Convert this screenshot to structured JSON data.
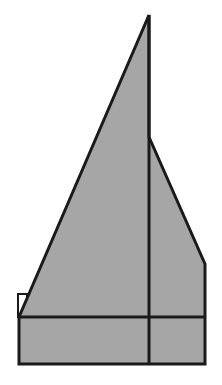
{
  "diagram": {
    "width": 222,
    "height": 385,
    "colors": {
      "fill": "#a6a6a6",
      "stroke": "#1a1a1a",
      "background": "#ffffff",
      "small_box_fill": "#ffffff"
    },
    "stroke_width": 3,
    "shapes": {
      "main_polygon": "149,15 149,137 205,264 205,364 19,364 19,317",
      "small_square": {
        "x": 18,
        "y": 294,
        "w": 9,
        "h": 23
      },
      "vertical_divider": {
        "x1": 149,
        "y1": 15,
        "x2": 149,
        "y2": 364
      },
      "horizontal_divider": {
        "x1": 19,
        "y1": 317,
        "x2": 205,
        "y2": 317
      },
      "right_slope": {
        "x1": 149,
        "y1": 137,
        "x2": 205,
        "y2": 264
      }
    }
  }
}
